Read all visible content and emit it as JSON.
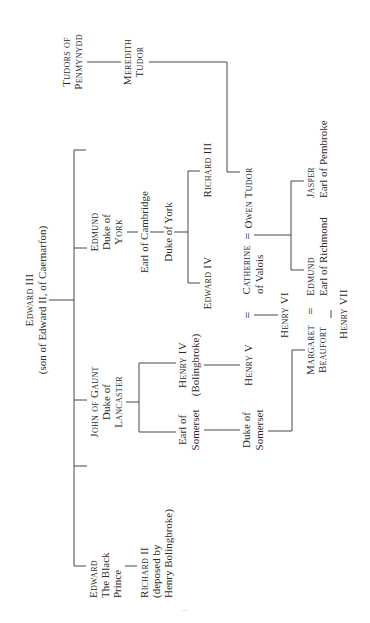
{
  "orientation": "rotated 90° counter-clockwise (text reads bottom-to-top)",
  "nodes": {
    "edward_iii": {
      "name": "Edward III",
      "sub": "(son of Edward II, of Caernarfon)"
    },
    "black_prince": {
      "l1": "Edward",
      "l2": "The Black",
      "l3": "Prince"
    },
    "richard_ii": {
      "l1": "Richard II",
      "l2": "(deposed by",
      "l3": "Henry Bolingbroke)"
    },
    "john_of_gaunt": {
      "l1": "John of Gaunt",
      "l2": "Duke of",
      "l3": "Lancaster"
    },
    "earl_somerset": {
      "l1": "Earl of",
      "l2": "Somerset"
    },
    "duke_somerset": {
      "l1": "Duke of",
      "l2": "Somerset"
    },
    "henry_iv": {
      "l1": "Henry IV",
      "l2": "(Bolingbroke)"
    },
    "henry_v": {
      "name": "Henry V"
    },
    "catherine": {
      "l1": "Catherine",
      "l2": "of Valois"
    },
    "henry_vi": {
      "name": "Henry VI"
    },
    "margaret": {
      "l1": "Margaret",
      "l2": "Beaufort"
    },
    "edmund_richmond": {
      "l1": "Edmund",
      "l2": "Earl of Richmond"
    },
    "henry_vii": {
      "name": "Henry VII"
    },
    "edmund_york": {
      "l1": "Edmund",
      "l2": "Duke of",
      "l3": "York"
    },
    "earl_cambridge": {
      "name": "Earl of Cambridge"
    },
    "duke_york": {
      "name": "Duke of York"
    },
    "edward_iv": {
      "name": "Edward IV"
    },
    "richard_iii": {
      "name": "Richard III"
    },
    "owen_tudor": {
      "name": "Owen Tudor"
    },
    "tudors_penmynydd": {
      "l1": "Tudors of",
      "l2": "Penmynydd"
    },
    "meredith_tudor": {
      "l1": "Meredith",
      "l2": "Tudor"
    },
    "jasper": {
      "l1": "Jasper",
      "l2": "Earl of Pembroke"
    }
  },
  "marriage_symbol": "=",
  "page_number": "—"
}
